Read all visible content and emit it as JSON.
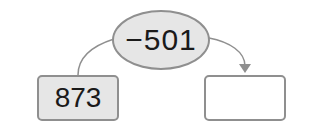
{
  "diagram": {
    "operation": {
      "label": "−501",
      "shape": "ellipse"
    },
    "start_value": {
      "label": "873"
    },
    "result_value": {
      "label": ""
    }
  },
  "colors": {
    "border": "#8f8f8f",
    "fill": "#e6e6e6",
    "line": "#8f8f8f"
  }
}
